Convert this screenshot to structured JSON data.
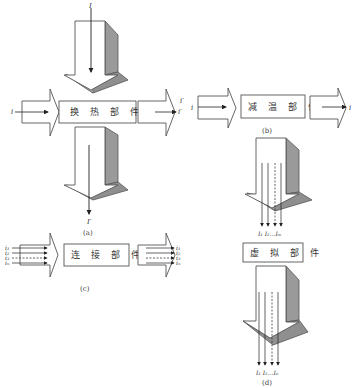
{
  "colors": {
    "stroke": "#555555",
    "shade": "#9a9a9a",
    "shade_dark": "#8a8a8a",
    "background": "#ffffff"
  },
  "panel_a": {
    "component_label": "换 热 部 件",
    "caption": "(a)",
    "input_top": "I",
    "output_bottom": "I′",
    "input_left": "i",
    "output_right": "i′"
  },
  "panel_b": {
    "component_label": "减 温 部 件",
    "caption": "(b)",
    "input_left": "i′",
    "input_left_inner": "i",
    "output_right": "i"
  },
  "panel_c": {
    "component_label": "连 接 部 件",
    "caption": "(c)",
    "inputs_left": [
      "i₁",
      "i₂",
      "i₃",
      "iₙ"
    ],
    "outputs_right": [
      "i₁",
      "i₂",
      "i₃",
      "iₙ"
    ]
  },
  "panel_d": {
    "component_label": "虚 拟 部 件",
    "caption": "(d)",
    "inputs_label": "I₁ I₂…Iₘ",
    "outputs_label": "I₁ I₂…Iₙ"
  }
}
